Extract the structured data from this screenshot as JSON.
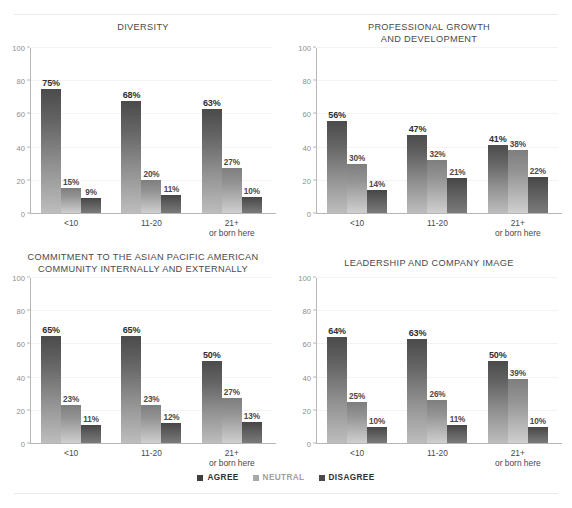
{
  "chart_data": [
    {
      "type": "bar",
      "title": "DIVERSITY",
      "xlabel": "",
      "ylabel": "",
      "ylim": [
        0,
        100
      ],
      "yticks": [
        0,
        20,
        40,
        60,
        80,
        100
      ],
      "grid": true,
      "legend_position": "bottom-figure",
      "categories": [
        "<10",
        "11-20",
        "21+\nor born here"
      ],
      "series": [
        {
          "name": "AGREE",
          "values": [
            75,
            68,
            63
          ],
          "labels": [
            "75%",
            "68%",
            "63%"
          ]
        },
        {
          "name": "NEUTRAL",
          "values": [
            15,
            20,
            27
          ],
          "labels": [
            "15%",
            "20%",
            "27%"
          ]
        },
        {
          "name": "DISAGREE",
          "values": [
            9,
            11,
            10
          ],
          "labels": [
            "9%",
            "11%",
            "10%"
          ]
        }
      ]
    },
    {
      "type": "bar",
      "title": "PROFESSIONAL GROWTH\nAND DEVELOPMENT",
      "xlabel": "",
      "ylabel": "",
      "ylim": [
        0,
        100
      ],
      "yticks": [
        0,
        20,
        40,
        60,
        80,
        100
      ],
      "grid": true,
      "legend_position": "bottom-figure",
      "categories": [
        "<10",
        "11-20",
        "21+\nor born here"
      ],
      "series": [
        {
          "name": "AGREE",
          "values": [
            56,
            47,
            41
          ],
          "labels": [
            "56%",
            "47%",
            "41%"
          ]
        },
        {
          "name": "NEUTRAL",
          "values": [
            30,
            32,
            38
          ],
          "labels": [
            "30%",
            "32%",
            "38%"
          ]
        },
        {
          "name": "DISAGREE",
          "values": [
            14,
            21,
            22
          ],
          "labels": [
            "14%",
            "21%",
            "22%"
          ]
        }
      ]
    },
    {
      "type": "bar",
      "title": "COMMITMENT TO THE ASIAN PACIFIC AMERICAN\nCOMMUNITY INTERNALLY AND EXTERNALLY",
      "xlabel": "",
      "ylabel": "",
      "ylim": [
        0,
        100
      ],
      "yticks": [
        0,
        20,
        40,
        60,
        80,
        100
      ],
      "grid": true,
      "legend_position": "bottom-figure",
      "categories": [
        "<10",
        "11-20",
        "21+\nor born here"
      ],
      "series": [
        {
          "name": "AGREE",
          "values": [
            65,
            65,
            50
          ],
          "labels": [
            "65%",
            "65%",
            "50%"
          ]
        },
        {
          "name": "NEUTRAL",
          "values": [
            23,
            23,
            27
          ],
          "labels": [
            "23%",
            "23%",
            "27%"
          ]
        },
        {
          "name": "DISAGREE",
          "values": [
            11,
            12,
            13
          ],
          "labels": [
            "11%",
            "12%",
            "13%"
          ]
        }
      ]
    },
    {
      "type": "bar",
      "title": "LEADERSHIP AND COMPANY IMAGE",
      "xlabel": "",
      "ylabel": "",
      "ylim": [
        0,
        100
      ],
      "yticks": [
        0,
        20,
        40,
        60,
        80,
        100
      ],
      "grid": true,
      "legend_position": "bottom-figure",
      "categories": [
        "<10",
        "11-20",
        "21+\nor born here"
      ],
      "series": [
        {
          "name": "AGREE",
          "values": [
            64,
            63,
            50
          ],
          "labels": [
            "64%",
            "63%",
            "50%"
          ]
        },
        {
          "name": "NEUTRAL",
          "values": [
            25,
            26,
            39
          ],
          "labels": [
            "25%",
            "26%",
            "39%"
          ]
        },
        {
          "name": "DISAGREE",
          "values": [
            10,
            11,
            10
          ],
          "labels": [
            "10%",
            "11%",
            "10%"
          ]
        }
      ]
    }
  ],
  "panels": [
    {
      "title": "DIVERSITY"
    },
    {
      "title": "PROFESSIONAL GROWTH\nAND DEVELOPMENT"
    },
    {
      "title": "COMMITMENT TO THE ASIAN PACIFIC AMERICAN\nCOMMUNITY INTERNALLY AND EXTERNALLY"
    },
    {
      "title": "LEADERSHIP AND COMPANY IMAGE"
    }
  ],
  "yticks": [
    "100",
    "80",
    "60",
    "40",
    "20",
    "0"
  ],
  "categories": [
    "<10",
    "11-20",
    "21+\nor born here"
  ],
  "legend": {
    "items": [
      {
        "label": "AGREE",
        "color": "#3f3f3f"
      },
      {
        "label": "NEUTRAL",
        "color": "#a8a8a8"
      },
      {
        "label": "DISAGREE",
        "color": "#4a4a4a"
      }
    ]
  },
  "colors": {
    "agree_top": "#4b4b4b",
    "agree_bottom": "#bdbdbd",
    "neutral_top": "#7e7e7e",
    "neutral_bottom": "#cfcfcf",
    "disagree_top": "#464646",
    "disagree_bottom": "#7a7a7a",
    "axis": "#b6b6b6",
    "text": "#4a4a4a",
    "background": "#ffffff"
  }
}
